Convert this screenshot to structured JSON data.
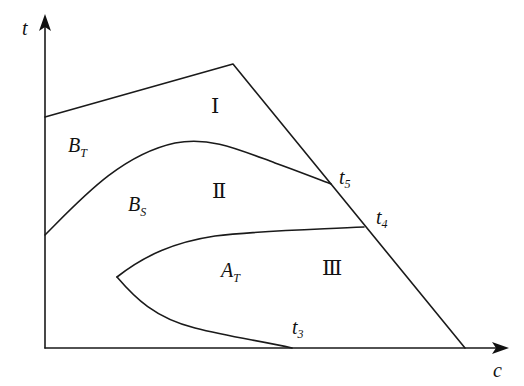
{
  "diagram": {
    "type": "phase-region diagram",
    "axes": {
      "x_label": "c",
      "y_label": "t"
    },
    "regions": [
      {
        "id": "I",
        "label": "Ⅰ"
      },
      {
        "id": "II",
        "label": "Ⅱ"
      },
      {
        "id": "III",
        "label": "Ⅲ"
      }
    ],
    "phase_labels": [
      {
        "id": "BT",
        "main": "B",
        "sub": "T"
      },
      {
        "id": "BS",
        "main": "B",
        "sub": "S"
      },
      {
        "id": "AT",
        "main": "A",
        "sub": "T"
      }
    ],
    "points": [
      {
        "id": "t5",
        "main": "t",
        "sub": "5"
      },
      {
        "id": "t4",
        "main": "t",
        "sub": "4"
      },
      {
        "id": "t3",
        "main": "t",
        "sub": "3"
      }
    ]
  }
}
